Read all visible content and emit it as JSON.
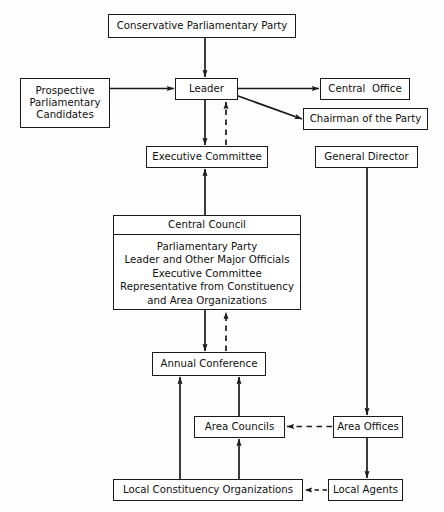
{
  "diagram": {
    "nodes": [
      {
        "id": "conservative-parliamentary-party",
        "label": "Conservative Parliamentary Party"
      },
      {
        "id": "prospective-parliamentary-candidates",
        "lines": [
          "Prospective",
          "Parliamentary",
          "Candidates"
        ]
      },
      {
        "id": "leader",
        "label": "Leader"
      },
      {
        "id": "central-office",
        "label": "Central  Office"
      },
      {
        "id": "chairman-of-the-party",
        "label": "Chairman of the Party"
      },
      {
        "id": "executive-committee",
        "label": "Executive Committee"
      },
      {
        "id": "general-director",
        "label": "General Director"
      },
      {
        "id": "central-council",
        "title": "Central Council",
        "body": [
          "Parliamentary Party",
          "Leader and Other Major Officials",
          "Executive Committee",
          "Representative from Constituency",
          "and Area Organizations"
        ]
      },
      {
        "id": "annual-conference",
        "label": "Annual Conference"
      },
      {
        "id": "area-councils",
        "label": "Area Councils"
      },
      {
        "id": "area-offices",
        "label": "Area Offices"
      },
      {
        "id": "local-constituency-organizations",
        "label": "Local Constituency Organizations"
      },
      {
        "id": "local-agents",
        "label": "Local Agents"
      }
    ],
    "edges": [
      {
        "from": "conservative-parliamentary-party",
        "to": "leader",
        "style": "solid",
        "direction": "down"
      },
      {
        "from": "prospective-parliamentary-candidates",
        "to": "leader",
        "style": "solid",
        "direction": "right"
      },
      {
        "from": "leader",
        "to": "central-office",
        "style": "solid",
        "direction": "right"
      },
      {
        "from": "leader",
        "to": "chairman-of-the-party",
        "style": "solid",
        "direction": "diagonal-down-right"
      },
      {
        "from": "leader",
        "to": "executive-committee",
        "style": "solid",
        "direction": "down"
      },
      {
        "from": "executive-committee",
        "to": "leader",
        "style": "dashed",
        "direction": "up"
      },
      {
        "from": "central-council",
        "to": "executive-committee",
        "style": "solid",
        "direction": "up"
      },
      {
        "from": "central-council",
        "to": "annual-conference",
        "style": "solid",
        "direction": "down"
      },
      {
        "from": "annual-conference",
        "to": "central-council",
        "style": "dashed",
        "direction": "up"
      },
      {
        "from": "general-director",
        "to": "area-offices",
        "style": "solid",
        "direction": "down"
      },
      {
        "from": "area-offices",
        "to": "area-councils",
        "style": "dashed",
        "direction": "left"
      },
      {
        "from": "area-offices",
        "to": "local-agents",
        "style": "solid",
        "direction": "down"
      },
      {
        "from": "area-councils",
        "to": "annual-conference",
        "style": "solid",
        "direction": "up"
      },
      {
        "from": "local-constituency-organizations",
        "to": "annual-conference",
        "style": "solid",
        "direction": "up"
      },
      {
        "from": "local-constituency-organizations",
        "to": "area-councils",
        "style": "solid",
        "direction": "up"
      },
      {
        "from": "local-agents",
        "to": "local-constituency-organizations",
        "style": "dashed",
        "direction": "left"
      }
    ],
    "colors": {
      "line": "#1a1a1a",
      "box_border": "#1a1a1a",
      "box_fill": "#ffffff",
      "text": "#111111",
      "background": "#fdfdfd"
    }
  }
}
